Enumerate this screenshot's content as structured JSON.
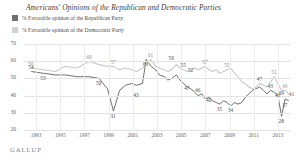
{
  "header": {
    "title": "Americans' Opinions of the Republican and Democratic Parties"
  },
  "legend": [
    {
      "key": "republican",
      "label": "% Favorable opinion of the Republican Party",
      "color": "#6e6e6e",
      "icon": "legend-swatch"
    },
    {
      "key": "democratic",
      "label": "% Favorable opinion of the Democratic Party",
      "color": "#d2d2d2",
      "icon": "legend-swatch"
    }
  ],
  "source": {
    "label": "GALLUP"
  },
  "chart_data": {
    "type": "line",
    "title": "Americans' Opinions of the Republican and Democratic Parties",
    "xlabel": "",
    "ylabel": "",
    "ylim": [
      20,
      70
    ],
    "xlim": [
      1992,
      2014
    ],
    "grid": true,
    "legend_position": "top-left",
    "yticks": [
      70,
      60,
      50,
      40,
      30,
      20
    ],
    "xticks": [
      "1993",
      "1995",
      "1997",
      "1999",
      "2001",
      "2003",
      "2005",
      "2007",
      "2009",
      "2011",
      "2013"
    ],
    "series": [
      {
        "name": "% Favorable opinion of the Republican Party",
        "color": "#5f5f5f",
        "x": [
          1992.6,
          1993.6,
          1994.6,
          1995.4,
          1996.4,
          1997.4,
          1998.2,
          1998.9,
          1999.4,
          1999.9,
          2000.4,
          2000.9,
          2001.3,
          2001.8,
          2002.1,
          2002.5,
          2002.9,
          2003.2,
          2003.6,
          2003.9,
          2004.2,
          2004.6,
          2004.9,
          2005.2,
          2005.5,
          2005.8,
          2006.1,
          2006.4,
          2006.7,
          2007.0,
          2007.3,
          2007.6,
          2007.9,
          2008.2,
          2008.5,
          2008.8,
          2009.1,
          2009.4,
          2009.7,
          2010.0,
          2010.3,
          2010.6,
          2010.9,
          2011.2,
          2011.5,
          2011.8,
          2012.1,
          2012.4,
          2012.7,
          2013.0,
          2013.3,
          2013.6,
          2013.9
        ],
        "y": [
          54,
          53,
          52,
          52,
          51,
          51,
          50,
          44,
          31,
          43,
          46,
          47,
          46,
          47,
          61,
          57,
          55,
          52,
          51,
          49,
          50,
          52,
          49,
          47,
          45,
          44,
          42,
          40,
          41,
          38,
          39,
          37,
          36,
          35,
          37,
          36,
          34,
          36,
          35,
          36,
          39,
          41,
          43,
          44,
          45,
          43,
          41,
          43,
          42,
          40,
          28,
          38,
          37
        ]
      },
      {
        "name": "% Favorable opinion of the Democratic Party",
        "color": "#c9c9c9",
        "x": [
          1992.6,
          1993.6,
          1994.6,
          1995.4,
          1996.4,
          1997.4,
          1998.2,
          1998.9,
          1999.4,
          1999.9,
          2000.4,
          2000.9,
          2001.3,
          2001.8,
          2002.1,
          2002.5,
          2002.9,
          2003.2,
          2003.6,
          2003.9,
          2004.2,
          2004.6,
          2004.9,
          2005.2,
          2005.5,
          2005.8,
          2006.1,
          2006.4,
          2006.7,
          2007.0,
          2007.3,
          2007.6,
          2007.9,
          2008.2,
          2008.5,
          2008.8,
          2009.1,
          2009.4,
          2009.7,
          2010.0,
          2010.3,
          2010.6,
          2010.9,
          2011.2,
          2011.5,
          2011.8,
          2012.1,
          2012.4,
          2012.7,
          2013.0,
          2013.3,
          2013.6,
          2013.9
        ],
        "y": [
          56,
          55,
          54,
          57,
          56,
          60,
          58,
          57,
          57,
          55,
          56,
          55,
          54,
          56,
          58,
          61,
          57,
          56,
          55,
          54,
          55,
          58,
          56,
          55,
          54,
          55,
          56,
          55,
          56,
          57,
          55,
          54,
          55,
          53,
          54,
          55,
          56,
          53,
          51,
          48,
          47,
          45,
          44,
          45,
          47,
          46,
          45,
          48,
          51,
          47,
          43,
          43,
          41
        ]
      }
    ],
    "point_labels": [
      {
        "series": "republican",
        "value": "54",
        "x": 1992.6,
        "y": 54,
        "pos": "above"
      },
      {
        "series": "democratic",
        "value": "56",
        "x": 1992.6,
        "y": 56,
        "pos": "above"
      },
      {
        "series": "republican",
        "value": "53",
        "x": 1993.6,
        "y": 53,
        "pos": "below"
      },
      {
        "series": "democratic",
        "value": "60",
        "x": 1997.4,
        "y": 60,
        "pos": "above"
      },
      {
        "series": "republican",
        "value": "50",
        "x": 1998.2,
        "y": 50,
        "pos": "below"
      },
      {
        "series": "democratic",
        "value": "57",
        "x": 1999.4,
        "y": 57,
        "pos": "above"
      },
      {
        "series": "republican",
        "value": "31",
        "x": 1999.4,
        "y": 31,
        "pos": "below"
      },
      {
        "series": "republican",
        "value": "43",
        "x": 2001.3,
        "y": 43,
        "pos": "below"
      },
      {
        "series": "democratic",
        "value": "61",
        "x": 2002.5,
        "y": 61,
        "pos": "above"
      },
      {
        "series": "republican",
        "value": "61",
        "x": 2002.1,
        "y": 61,
        "pos": "below"
      },
      {
        "series": "republican",
        "value": "59",
        "x": 2004.2,
        "y": 59,
        "pos": "above"
      },
      {
        "series": "republican",
        "value": "55",
        "x": 2005.2,
        "y": 55,
        "pos": "above"
      },
      {
        "series": "republican",
        "value": "52",
        "x": 2005.8,
        "y": 52,
        "pos": "above"
      },
      {
        "series": "republican",
        "value": "47",
        "x": 2005.5,
        "y": 47,
        "pos": "below"
      },
      {
        "series": "republican",
        "value": "46",
        "x": 2006.4,
        "y": 46,
        "pos": "below"
      },
      {
        "series": "republican",
        "value": "40",
        "x": 2007.3,
        "y": 40,
        "pos": "below"
      },
      {
        "series": "democratic",
        "value": "57",
        "x": 2007.0,
        "y": 57,
        "pos": "above"
      },
      {
        "series": "democratic",
        "value": "55",
        "x": 2008.8,
        "y": 55,
        "pos": "above"
      },
      {
        "series": "republican",
        "value": "35",
        "x": 2008.2,
        "y": 35,
        "pos": "below"
      },
      {
        "series": "republican",
        "value": "34",
        "x": 2009.1,
        "y": 34,
        "pos": "below"
      },
      {
        "series": "republican",
        "value": "47",
        "x": 2011.5,
        "y": 47,
        "pos": "above"
      },
      {
        "series": "democratic",
        "value": "51",
        "x": 2012.7,
        "y": 51,
        "pos": "above"
      },
      {
        "series": "republican",
        "value": "43",
        "x": 2012.4,
        "y": 43,
        "pos": "above"
      },
      {
        "series": "democratic",
        "value": "43",
        "x": 2013.6,
        "y": 43,
        "pos": "above"
      },
      {
        "series": "republican",
        "value": "43",
        "x": 2013.0,
        "y": 43,
        "pos": "below"
      },
      {
        "series": "republican",
        "value": "39",
        "x": 2013.3,
        "y": 39,
        "pos": "above"
      },
      {
        "series": "republican",
        "value": "37",
        "x": 2013.6,
        "y": 37,
        "pos": "below"
      },
      {
        "series": "republican",
        "value": "28",
        "x": 2013.3,
        "y": 28,
        "pos": "below"
      },
      {
        "series": "republican",
        "value": "41",
        "x": 2013.9,
        "y": 41,
        "pos": "right"
      }
    ]
  }
}
